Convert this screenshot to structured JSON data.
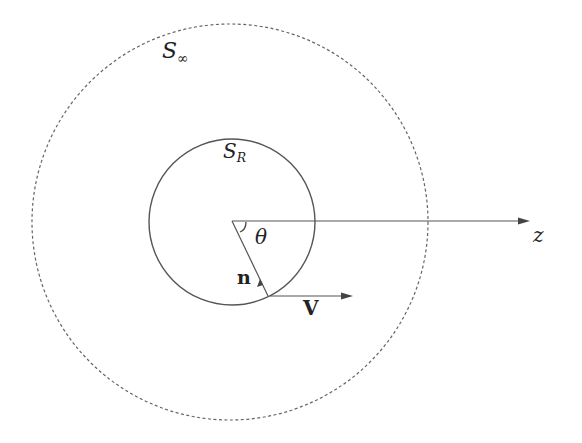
{
  "diagram": {
    "labels": {
      "outer_surface": {
        "symbol": "S",
        "subscript": "∞"
      },
      "inner_surface": {
        "symbol": "S",
        "subscript": "R"
      },
      "angle": "θ",
      "normal": "n",
      "velocity": "V",
      "axis": "z"
    },
    "colors": {
      "stroke": "#555555",
      "text": "#222222",
      "background": "#ffffff"
    }
  }
}
